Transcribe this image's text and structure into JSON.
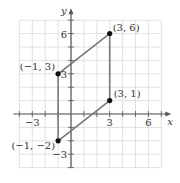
{
  "chart_data": {
    "type": "line",
    "title": "",
    "xlabel": "x",
    "ylabel": "y",
    "xlim": [
      -4,
      7
    ],
    "ylim": [
      -4,
      7
    ],
    "grid": true,
    "x_ticks": [
      -3,
      3,
      6
    ],
    "y_ticks": [
      6,
      3,
      -3
    ],
    "x_tick_labels": [
      "−3",
      "3",
      "6"
    ],
    "y_tick_labels": [
      "6",
      "3",
      "−3"
    ],
    "shape": "parallelogram",
    "points": [
      {
        "x": 3,
        "y": 6,
        "label": "(3, 6)"
      },
      {
        "x": 3,
        "y": 1,
        "label": "(3, 1)"
      },
      {
        "x": -1,
        "y": -2,
        "label": "(−1, −2)"
      },
      {
        "x": -1,
        "y": 3,
        "label": "(−1, 3)"
      }
    ],
    "series": [
      {
        "name": "parallelogram",
        "x": [
          3,
          3,
          -1,
          -1,
          3
        ],
        "y": [
          6,
          1,
          -2,
          3,
          6
        ]
      }
    ]
  },
  "colors": {
    "grid": "#d9d9d9",
    "axis": "#555555",
    "edge": "#777777",
    "point": "#111111",
    "text": "#333333"
  }
}
